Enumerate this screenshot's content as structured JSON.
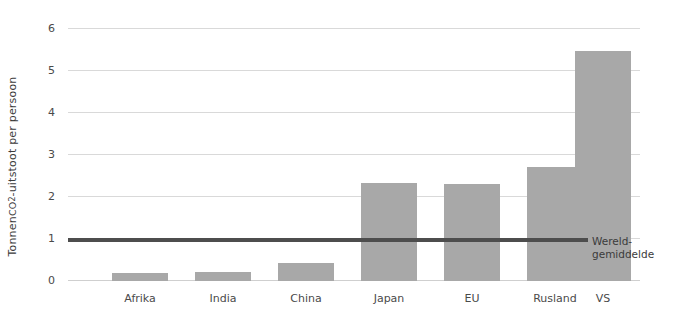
{
  "chart_data": {
    "type": "bar",
    "title": "",
    "xlabel": "",
    "ylabel": "Tonnen CO2-uitstoot per persoon",
    "ylabel_parts": {
      "prefix": "Tonnen ",
      "co": "CO",
      "subscript": "2",
      "suffix": "-uitstoot per persoon"
    },
    "categories": [
      "Afrika",
      "India",
      "China",
      "Japan",
      "EU",
      "Rusland",
      "VS"
    ],
    "values": [
      0.2,
      0.22,
      0.43,
      2.33,
      2.32,
      2.72,
      5.48
    ],
    "ylim": [
      0,
      6
    ],
    "ytick_labels": [
      "0",
      "1",
      "2",
      "3",
      "4",
      "5",
      "6"
    ],
    "ytick_values": [
      0,
      1,
      2,
      3,
      4,
      5,
      6
    ],
    "grid": true,
    "legend_position": "none",
    "bar_color": "#a8a8a8",
    "gridline_color": "#d9d9d9",
    "annotations": [
      {
        "name": "world-average",
        "label_line1": "Wereld-",
        "label_line2": "gemiddelde",
        "value": 1.0,
        "color": "#4d4d4d"
      }
    ]
  }
}
